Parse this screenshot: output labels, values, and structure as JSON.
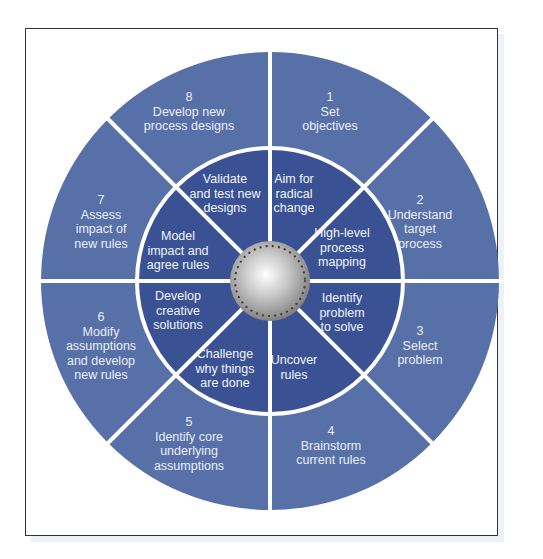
{
  "diagram": {
    "type": "circular-process-wheel",
    "colors": {
      "outer_ring": "#5870a8",
      "inner_ring": "#3a5294",
      "divider": "#ffffff",
      "hub": "#c8c8c8",
      "frame_border": "#333333"
    },
    "outer_steps": [
      {
        "number": "1",
        "label": "Set\nobjectives"
      },
      {
        "number": "2",
        "label": "Understand\ntarget\nprocess"
      },
      {
        "number": "3",
        "label": "Select\nproblem"
      },
      {
        "number": "4",
        "label": "Brainstorm\ncurrent rules"
      },
      {
        "number": "5",
        "label": "Identify core\nunderlying\nassumptions"
      },
      {
        "number": "6",
        "label": "Modify\nassumptions\nand develop\nnew rules"
      },
      {
        "number": "7",
        "label": "Assess\nimpact of\nnew rules"
      },
      {
        "number": "8",
        "label": "Develop new\nprocess designs"
      }
    ],
    "inner_steps": [
      {
        "label": "Aim for\nradical\nchange"
      },
      {
        "label": "High-level\nprocess\nmapping"
      },
      {
        "label": "Identify\nproblem\nto solve"
      },
      {
        "label": "Uncover\nrules"
      },
      {
        "label": "Challenge\nwhy things\nare done"
      },
      {
        "label": "Develop\ncreative\nsolutions"
      },
      {
        "label": "Model\nimpact and\nagree rules"
      },
      {
        "label": "Validate\nand test new\ndesigns"
      }
    ]
  },
  "outer_text": {
    "s1": "1\nSet\nobjectives",
    "s2": "2\nUnderstand\ntarget\nprocess",
    "s3": "3\nSelect\nproblem",
    "s4": "4\nBrainstorm\ncurrent rules",
    "s5": "5\nIdentify core\nunderlying\nassumptions",
    "s6": "6\nModify\nassumptions\nand develop\nnew rules",
    "s7": "7\nAssess\nimpact of\nnew rules",
    "s8": "8\nDevelop new\nprocess designs"
  }
}
